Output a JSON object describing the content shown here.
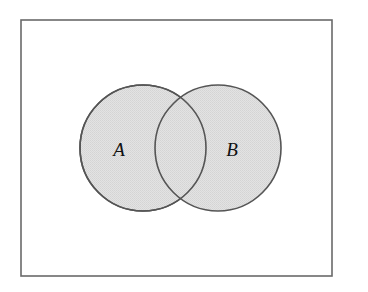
{
  "figure": {
    "kind": "venn-diagram",
    "width": 368,
    "height": 292,
    "background_color": "#ffffff"
  },
  "universe_box": {
    "name": "universal-set-rectangle",
    "x": 21,
    "y": 20,
    "width": 311,
    "height": 256,
    "stroke_color": "#6a6a6a",
    "stroke_width": 1.6,
    "fill_color": "none"
  },
  "sets": [
    {
      "id": "A",
      "label": "A",
      "cx": 143,
      "cy": 148,
      "r": 63,
      "fill_color": "#dfdfdf",
      "stroke_color": "#555555",
      "stroke_width": 1.6,
      "label_x": 119,
      "label_y": 152
    },
    {
      "id": "B",
      "label": "B",
      "cx": 218,
      "cy": 148,
      "r": 63,
      "fill_color": "#dfdfdf",
      "stroke_color": "#555555",
      "stroke_width": 1.6,
      "label_x": 232,
      "label_y": 152
    }
  ],
  "intersection": {
    "name": "A-intersect-B",
    "top_point_x": 181,
    "top_point_y": 92,
    "bottom_point_x": 181,
    "bottom_point_y": 203,
    "fill_color": "#dfdfdf",
    "shaded": true
  },
  "chart_data": {
    "type": "venn",
    "title": "",
    "sets": [
      "A",
      "B"
    ],
    "set_labels": [
      "A",
      "B"
    ],
    "overlap": true,
    "shaded_regions": [
      "A",
      "B",
      "A∩B"
    ],
    "centers": [
      [
        143,
        148
      ],
      [
        218,
        148
      ]
    ],
    "radii": [
      63,
      63
    ],
    "center_distance": 75,
    "fill_colors": [
      "#dfdfdf",
      "#dfdfdf"
    ],
    "stroke_color": "#555555",
    "container": {
      "label": "",
      "x": 21,
      "y": 20,
      "width": 311,
      "height": 256
    }
  }
}
